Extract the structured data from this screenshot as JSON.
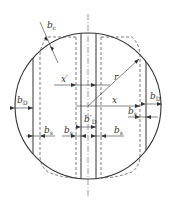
{
  "colors": {
    "stroke": "#333333",
    "background": "#ffffff"
  },
  "labels": {
    "b_c": {
      "main": "b",
      "sub": "c"
    },
    "r": {
      "main": "r",
      "sub": ""
    },
    "x_prime": {
      "main": "x′",
      "sub": ""
    },
    "x": {
      "main": "x",
      "sub": ""
    },
    "b_D_left": {
      "main": "b",
      "sub": "D"
    },
    "b_D_right": {
      "main": "b",
      "sub": "D"
    },
    "b_D_prime": {
      "main": "b′",
      "sub": "D"
    },
    "b_s_left_outer": {
      "main": "b",
      "sub": "s"
    },
    "b_s_left_inner": {
      "main": "b",
      "sub": "s"
    },
    "b_s_center_right": {
      "main": "b",
      "sub": "s"
    },
    "b_s_right": {
      "main": "b",
      "sub": "s"
    }
  }
}
